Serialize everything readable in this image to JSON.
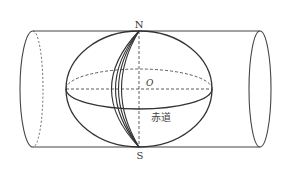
{
  "diagram": {
    "type": "cylindrical-projection",
    "labels": {
      "north": "N",
      "south": "S",
      "center": "O",
      "equator": "赤道"
    },
    "colors": {
      "stroke": "#333333",
      "background": "#ffffff"
    }
  }
}
